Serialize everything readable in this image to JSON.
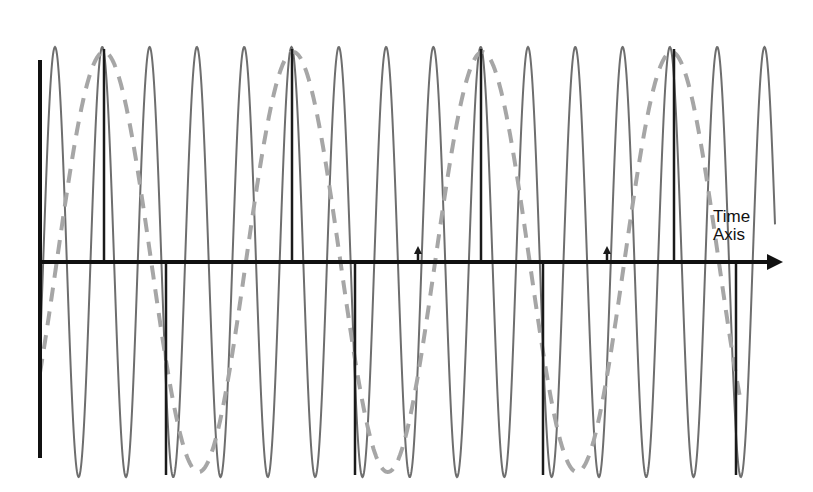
{
  "diagram": {
    "axis_label_line1": "Time",
    "axis_label_line2": "Axis",
    "colors": {
      "axis": "#111111",
      "signal": "#6e6e6e",
      "alias": "#a6a6a6",
      "sample": "#1a1a1a"
    },
    "geometry": {
      "axis_y": 262,
      "axis_x_start": 38,
      "axis_x_end": 783,
      "vaxis_x": 40,
      "vaxis_top": 60,
      "vaxis_bottom": 458,
      "signal_amplitude": 215,
      "signal_period": 47.3,
      "signal_first_peak_x": 55,
      "alias_amplitude": 210,
      "alias_period": 189.2,
      "alias_start_x": 40,
      "end_x": 775
    },
    "samples": [
      {
        "x": 104,
        "type": "peak"
      },
      {
        "x": 166,
        "type": "trough"
      },
      {
        "x": 292,
        "type": "peak"
      },
      {
        "x": 355,
        "type": "trough"
      },
      {
        "x": 418,
        "type": "zero"
      },
      {
        "x": 481,
        "type": "peak"
      },
      {
        "x": 543,
        "type": "trough"
      },
      {
        "x": 607,
        "type": "zero"
      },
      {
        "x": 674,
        "type": "peak"
      },
      {
        "x": 736,
        "type": "trough"
      }
    ]
  }
}
